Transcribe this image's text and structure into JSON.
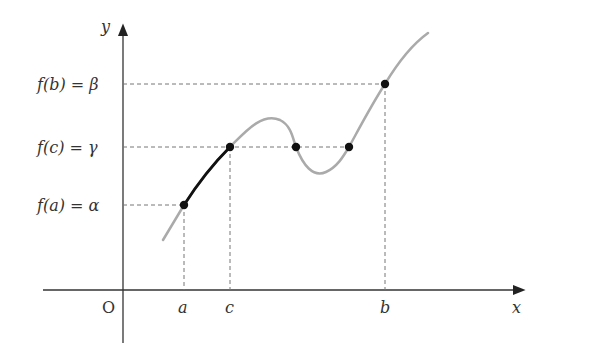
{
  "diagram": {
    "axes": {
      "x_label": "x",
      "y_label": "y",
      "origin_label": "O"
    },
    "x_ticks": [
      {
        "label": "a",
        "x": 184
      },
      {
        "label": "c",
        "x": 230
      },
      {
        "label": "b",
        "x": 385
      }
    ],
    "y_ticks": [
      {
        "label": "f(b) = β",
        "y": 84
      },
      {
        "label": "f(c) = γ",
        "y": 147
      },
      {
        "label": "f(a) = α",
        "y": 205
      }
    ],
    "points": [
      {
        "name": "A",
        "x": 184,
        "y": 205
      },
      {
        "name": "C",
        "x": 230,
        "y": 147
      },
      {
        "name": "P1",
        "x": 296,
        "y": 147
      },
      {
        "name": "P2",
        "x": 349,
        "y": 147
      },
      {
        "name": "B",
        "x": 385,
        "y": 84
      }
    ],
    "colors": {
      "curve": "#aaaaaa",
      "highlight": "#111111",
      "axis": "#333333",
      "guide": "#777777",
      "point": "#111111"
    }
  }
}
